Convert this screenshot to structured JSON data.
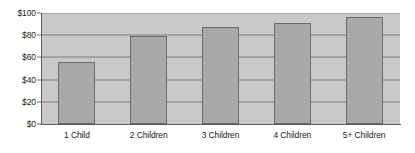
{
  "chart_data": {
    "type": "bar",
    "title": "",
    "subtitle": "",
    "xlabel": "",
    "ylabel": "",
    "categories": [
      "1 Child",
      "2 Children",
      "3 Children",
      "4 Children",
      "5+ Children"
    ],
    "values": [
      56,
      79,
      87,
      91,
      96
    ],
    "ylim": [
      0,
      100
    ],
    "ytick_values": [
      0,
      20,
      40,
      60,
      80,
      100
    ],
    "ytick_labels": [
      "$0",
      "$20",
      "$40",
      "$60",
      "$80",
      "$100"
    ],
    "grid": {
      "horizontal": true,
      "vertical": false
    },
    "legend": {
      "visible": false,
      "position": "none",
      "entries": []
    },
    "annotations": [],
    "colors": {
      "bar_fill": "#a9a9a9",
      "bar_border": "#6b6b6b",
      "plot_background": "#c9c9c9",
      "gridline": "#7d7d7d",
      "axis_line": "#5a5a5a",
      "figure_background": "#ffffff",
      "text": "#1a1a1a"
    }
  }
}
